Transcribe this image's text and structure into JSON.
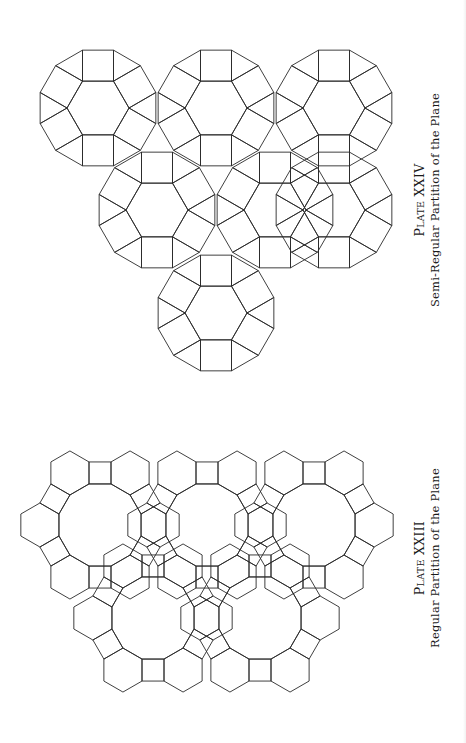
{
  "plates": [
    {
      "id": "plate-xxiv",
      "title_prefix": "P",
      "title_smallcaps": "LATE",
      "numeral": "XXIV",
      "subtitle": "Semi-Regular Partition of the Plane",
      "tiling": "3.4.6.4 (rhombitrihexagonal)",
      "tiles": [
        "hexagon",
        "square",
        "triangle"
      ],
      "stroke": "#2a2a2a"
    },
    {
      "id": "plate-xxiii",
      "title_prefix": "P",
      "title_smallcaps": "LATE",
      "numeral": "XXIII",
      "subtitle": "Regular Partition of the Plane",
      "tiling": "4.6.12 (truncated trihexagonal)",
      "tiles": [
        "dodecagon",
        "hexagon",
        "square"
      ],
      "stroke": "#2a2a2a"
    }
  ]
}
